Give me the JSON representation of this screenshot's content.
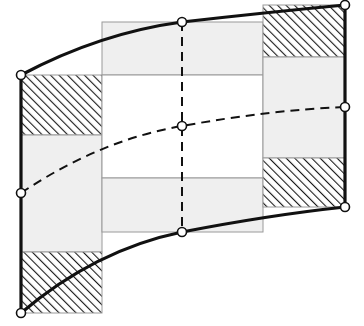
{
  "diagram": {
    "type": "curvilinear-mesh-element",
    "colors": {
      "background": "#ffffff",
      "stroke": "#111111",
      "grid_line": "#9a9a9a",
      "gray_fill": "#efefef",
      "hatch": "#1a1a1a",
      "node_fill": "#ffffff"
    },
    "columns": [
      {
        "name": "left",
        "x": 21,
        "width": 81,
        "bands": [
          {
            "kind": "hatched",
            "y": 75,
            "height": 60
          },
          {
            "kind": "gray",
            "y": 135,
            "height": 117
          },
          {
            "kind": "hatched",
            "y": 252,
            "height": 61
          }
        ]
      },
      {
        "name": "middle",
        "x": 102,
        "width": 161,
        "bands": [
          {
            "kind": "gray",
            "y": 22,
            "height": 53
          },
          {
            "kind": "white",
            "y": 75,
            "height": 103
          },
          {
            "kind": "gray",
            "y": 178,
            "height": 54
          }
        ]
      },
      {
        "name": "right",
        "x": 263,
        "width": 82,
        "bands": [
          {
            "kind": "hatched",
            "y": 5,
            "height": 52
          },
          {
            "kind": "gray",
            "y": 57,
            "height": 101
          },
          {
            "kind": "hatched",
            "y": 158,
            "height": 49
          }
        ]
      }
    ],
    "nodes": [
      {
        "id": "top-left",
        "x": 21,
        "y": 75
      },
      {
        "id": "top-mid",
        "x": 182,
        "y": 22
      },
      {
        "id": "top-right",
        "x": 345,
        "y": 5
      },
      {
        "id": "mid-left",
        "x": 21,
        "y": 193
      },
      {
        "id": "center",
        "x": 182,
        "y": 126
      },
      {
        "id": "mid-right",
        "x": 345,
        "y": 107
      },
      {
        "id": "bottom-left",
        "x": 21,
        "y": 313
      },
      {
        "id": "bottom-mid",
        "x": 182,
        "y": 232
      },
      {
        "id": "bottom-right",
        "x": 345,
        "y": 207
      }
    ],
    "edges": [
      {
        "id": "top-edge",
        "style": "solid",
        "path": "M21,75 Q100,33 182,22 Q270,12 345,5"
      },
      {
        "id": "bottom-edge",
        "style": "solid",
        "path": "M21,313 Q95,250 182,232 Q270,215 345,207"
      },
      {
        "id": "left-edge",
        "style": "solid",
        "path": "M21,75 L21,313"
      },
      {
        "id": "right-edge",
        "style": "solid",
        "path": "M345,5 L345,207"
      },
      {
        "id": "mid-horizontal",
        "style": "dashed",
        "path": "M21,193 Q100,140 182,126 Q270,110 345,107"
      },
      {
        "id": "mid-vertical",
        "style": "dashed",
        "path": "M182,22 L182,232"
      }
    ]
  }
}
